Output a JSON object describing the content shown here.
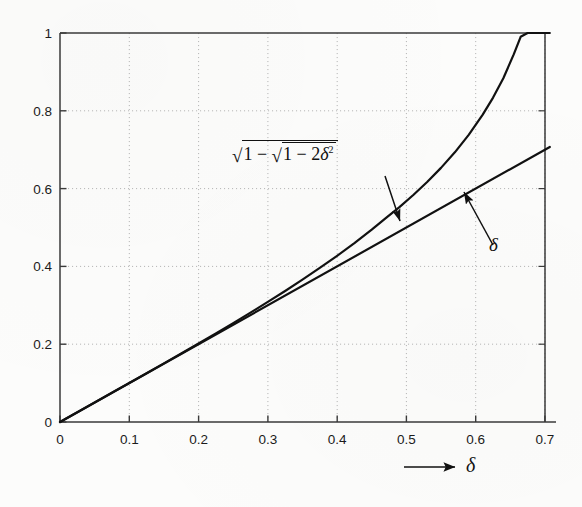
{
  "figure": {
    "kind": "scanned-book-figure",
    "background_color": "#fcfcfb",
    "ink_color": "#111111",
    "grid_color": "#b8b8b8"
  },
  "axis_arrow": {
    "name": "x-axis-direction-arrow",
    "label": "δ"
  },
  "annotations": [
    {
      "id": "curve-label-formula",
      "text": "√(1 − √(1 − 2δ²))",
      "outer_radical": "√",
      "inner_radical": "√",
      "expression_parts": [
        "1",
        "−",
        "1",
        "−",
        "2",
        "δ",
        "2"
      ],
      "arrow_from": [
        385,
        178
      ],
      "arrow_to": [
        399,
        222
      ]
    },
    {
      "id": "curve-label-delta",
      "text": "δ",
      "arrow_from": [
        492,
        243
      ],
      "arrow_to": [
        463,
        192
      ]
    }
  ],
  "chart_data": {
    "type": "line",
    "title": "",
    "xlabel": "δ",
    "ylabel": "",
    "xlim": [
      0,
      0.72
    ],
    "ylim": [
      0,
      1
    ],
    "grid": true,
    "grid_style": "dotted",
    "legend": "none (inline curve labels with arrows)",
    "xticks": [
      0,
      0.1,
      0.2,
      0.3,
      0.4,
      0.5,
      0.6,
      0.7
    ],
    "xticklabels": [
      "0",
      "0.1",
      "0.2",
      "0.3",
      "0.4",
      "0.5",
      "0.6",
      "0.7"
    ],
    "yticks": [
      0,
      0.2,
      0.4,
      0.6,
      0.8,
      1
    ],
    "yticklabels": [
      "0",
      "0.2",
      "0.4",
      "0.6",
      "0.8",
      "1"
    ],
    "x_axis_end_value": 0.7071,
    "series": [
      {
        "name": "sqrt(1 - sqrt(1 - 2*delta^2))",
        "label": "√(1 − √(1 − 2δ²))",
        "color": "#111111",
        "linewidth": 2.2,
        "x": [
          0,
          0.02,
          0.05,
          0.08,
          0.1,
          0.125,
          0.15,
          0.175,
          0.2,
          0.225,
          0.25,
          0.275,
          0.3,
          0.325,
          0.35,
          0.375,
          0.4,
          0.425,
          0.45,
          0.4707,
          0.49,
          0.51,
          0.53,
          0.55,
          0.57,
          0.59,
          0.61,
          0.625,
          0.64,
          0.655,
          0.665,
          0.675,
          0.685,
          0.692,
          0.698,
          0.702,
          0.7055,
          0.7071
        ],
        "y": [
          0,
          0.02,
          0.05,
          0.0802,
          0.1003,
          0.1255,
          0.1508,
          0.1762,
          0.2019,
          0.2279,
          0.2543,
          0.2812,
          0.3087,
          0.3369,
          0.3659,
          0.396,
          0.4273,
          0.46,
          0.4946,
          0.5249,
          0.5523,
          0.5836,
          0.617,
          0.6533,
          0.6932,
          0.738,
          0.7896,
          0.8334,
          0.8836,
          0.9449,
          0.9902,
          1.0,
          1.0,
          1.0,
          1.0,
          1.0,
          1.0,
          1.0
        ],
        "note": "y = sqrt(1 - sqrt(1 - 2x^2)); reaches 1 at x = 1/sqrt(2) ≈ 0.7071"
      },
      {
        "name": "delta",
        "label": "δ",
        "color": "#111111",
        "linewidth": 2.2,
        "x": [
          0,
          0.7071
        ],
        "y": [
          0,
          0.7071
        ],
        "note": "identity line y = delta"
      }
    ]
  }
}
